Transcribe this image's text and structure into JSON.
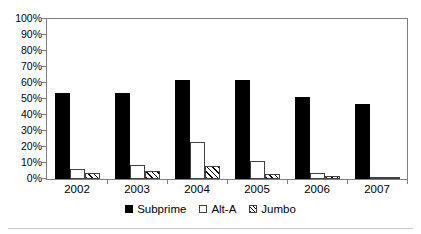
{
  "chart_data": {
    "type": "bar",
    "title": "",
    "subtitle": "",
    "xlabel": "",
    "ylabel": "",
    "categories": [
      "2002",
      "2003",
      "2004",
      "2005",
      "2006",
      "2007"
    ],
    "series": [
      {
        "name": "Subprime",
        "values": [
          54,
          54,
          62,
          62,
          51,
          47
        ],
        "style": "solid-black",
        "color": "#000000"
      },
      {
        "name": "Alt-A",
        "values": [
          6,
          9,
          23,
          11,
          4,
          1
        ],
        "style": "white-outline",
        "color": "#ffffff"
      },
      {
        "name": "Jumbo",
        "values": [
          4,
          5,
          8,
          3,
          2,
          1
        ],
        "style": "diagonal-hatch",
        "color": "#ffffff"
      }
    ],
    "ylim": [
      0,
      100
    ],
    "ytick_values": [
      0,
      10,
      20,
      30,
      40,
      50,
      60,
      70,
      80,
      90,
      100
    ],
    "ytick_labels": [
      "0%",
      "10%",
      "20%",
      "30%",
      "40%",
      "50%",
      "60%",
      "70%",
      "80%",
      "90%",
      "100%"
    ],
    "value_unit": "%",
    "grid": false,
    "legend_position": "bottom",
    "frame": true,
    "frame_color": "#7f7f7f"
  },
  "legend": {
    "entries": [
      {
        "label": "Subprime",
        "swatch": "filled-square-icon"
      },
      {
        "label": "Alt-A",
        "swatch": "empty-square-icon"
      },
      {
        "label": "Jumbo",
        "swatch": "hatched-square-icon"
      }
    ]
  }
}
